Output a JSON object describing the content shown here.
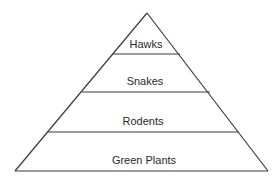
{
  "diagram": {
    "type": "food-pyramid",
    "levels": [
      {
        "label": "Hawks"
      },
      {
        "label": "Snakes"
      },
      {
        "label": "Rodents"
      },
      {
        "label": "Green Plants"
      }
    ]
  }
}
